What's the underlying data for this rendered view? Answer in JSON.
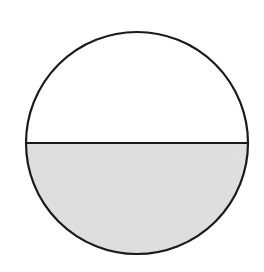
{
  "diagram": {
    "type": "fraction-circle",
    "parts_total": 2,
    "parts_shaded": 1,
    "fraction": "1/2",
    "shaded_region": "bottom",
    "colors": {
      "outline": "#1a1a1a",
      "shaded_fill": "#dcdcdc",
      "unshaded_fill": "#ffffff",
      "background": "#ffffff"
    },
    "geometry": {
      "center_x": 137,
      "center_y": 143,
      "radius": 111,
      "divider_y": 143
    }
  }
}
